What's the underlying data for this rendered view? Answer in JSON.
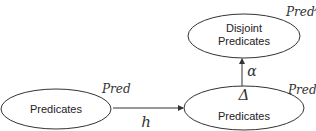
{
  "diagram": {
    "nodes": [
      {
        "id": "predicates-left",
        "label": "Predicates",
        "annotation": "Pred",
        "annotation_sup": ""
      },
      {
        "id": "predicates-right",
        "label": "Predicates",
        "annotation": "Pred",
        "annotation_sup": "∃",
        "inner_symbol": "Δ"
      },
      {
        "id": "disjoint-predicates",
        "label_line1": "Disjoint",
        "label_line2": "Predicates",
        "annotation": "Pred",
        "annotation_sup": "A"
      }
    ],
    "edges": [
      {
        "from": "predicates-left",
        "to": "predicates-right",
        "label": "h"
      },
      {
        "from": "predicates-right",
        "to": "disjoint-predicates",
        "label": "α"
      }
    ],
    "colors": {
      "stroke": "#333333",
      "text": "#222222",
      "background": "#ffffff"
    }
  }
}
